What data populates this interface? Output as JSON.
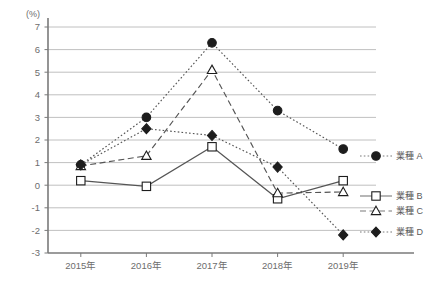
{
  "chart_data": {
    "type": "line",
    "title": "",
    "subtitle": "",
    "xlabel": "",
    "ylabel": "(%)",
    "unit_label": "(%)",
    "categories": [
      "2015年",
      "2016年",
      "2017年",
      "2018年",
      "2019年"
    ],
    "x": [
      2015,
      2016,
      2017,
      2018,
      2019
    ],
    "ylim": [
      -3,
      7
    ],
    "yticks": [
      7,
      6,
      5,
      4,
      3,
      2,
      1,
      0,
      -1,
      -2,
      -3
    ],
    "ytick_labels": [
      "7",
      "6",
      "5",
      "4",
      "3",
      "2",
      "1",
      "0",
      "-1",
      "-2",
      "-3"
    ],
    "grid": true,
    "grid_axis": "y",
    "legend_position": "right",
    "series": [
      {
        "name": "業種 A",
        "values": [
          0.9,
          3.0,
          6.3,
          3.3,
          1.6
        ],
        "marker": "filled-circle",
        "linestyle": "dotted",
        "color": "#555555"
      },
      {
        "name": "業種 B",
        "values": [
          0.2,
          -0.05,
          1.7,
          -0.6,
          0.2
        ],
        "marker": "open-square",
        "linestyle": "solid",
        "color": "#555555"
      },
      {
        "name": "業種 C",
        "values": [
          0.85,
          1.3,
          5.1,
          -0.35,
          -0.3
        ],
        "marker": "open-triangle",
        "linestyle": "dashed",
        "color": "#555555"
      },
      {
        "name": "業種 D",
        "values": [
          0.9,
          2.5,
          2.2,
          0.8,
          -2.2
        ],
        "marker": "filled-diamond",
        "linestyle": "dotted",
        "color": "#555555"
      }
    ],
    "legend_entries": [
      {
        "label": "業種 A",
        "marker": "filled-circle",
        "linestyle": "dotted"
      },
      {
        "label": "業種 B",
        "marker": "open-square",
        "linestyle": "solid"
      },
      {
        "label": "業種 C",
        "marker": "open-triangle",
        "linestyle": "dashed"
      },
      {
        "label": "業種 D",
        "marker": "filled-diamond",
        "linestyle": "dotted"
      }
    ],
    "colors": {
      "axis": "#7a7a7a",
      "grid": "#b9b9b9",
      "text": "#6d6d6d",
      "marker_fill": "#1d1d1d",
      "marker_open_fill": "#ffffff",
      "background": "#ffffff"
    }
  }
}
